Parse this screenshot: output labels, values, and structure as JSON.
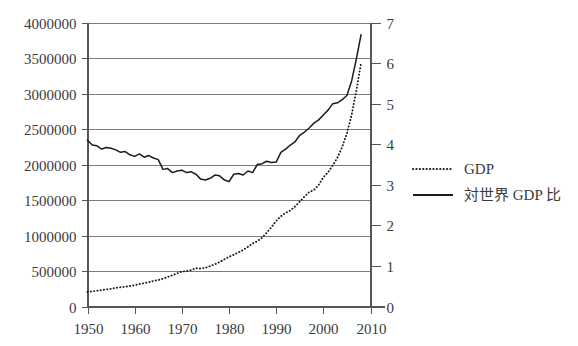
{
  "chart_data": {
    "type": "line",
    "title": "",
    "xlabel": "",
    "ylabel": "",
    "grid": true,
    "legend_position": "right",
    "x": [
      1950,
      1951,
      1952,
      1953,
      1954,
      1955,
      1956,
      1957,
      1958,
      1959,
      1960,
      1961,
      1962,
      1963,
      1964,
      1965,
      1966,
      1967,
      1968,
      1969,
      1970,
      1971,
      1972,
      1973,
      1974,
      1975,
      1976,
      1977,
      1978,
      1979,
      1980,
      1981,
      1982,
      1983,
      1984,
      1985,
      1986,
      1987,
      1988,
      1989,
      1990,
      1991,
      1992,
      1993,
      1994,
      1995,
      1996,
      1997,
      1998,
      1999,
      2000,
      2001,
      2002,
      2003,
      2004,
      2005,
      2006,
      2007,
      2008
    ],
    "xlim": [
      1950,
      2010
    ],
    "xticks": [
      1950,
      1960,
      1970,
      1980,
      1990,
      2000,
      2010
    ],
    "xticklabels": [
      "1950",
      "1960",
      "1970",
      "1980",
      "1990",
      "2000",
      "2010"
    ],
    "left_axis": {
      "name": "GDP",
      "ylim": [
        0,
        4000000
      ],
      "yticks": [
        0,
        500000,
        1000000,
        1500000,
        2000000,
        2500000,
        3000000,
        3500000,
        4000000
      ],
      "yticklabels": [
        "0",
        "500000",
        "1000000",
        "1500000",
        "2000000",
        "2500000",
        "3000000",
        "3500000",
        "4000000"
      ]
    },
    "right_axis": {
      "name": "対世界 GDP 比",
      "ylim": [
        0,
        7
      ],
      "yticks": [
        0,
        1,
        2,
        3,
        4,
        5,
        6,
        7
      ],
      "yticklabels": [
        "0",
        "1",
        "2",
        "3",
        "4",
        "5",
        "6",
        "7"
      ]
    },
    "series": [
      {
        "name": "GDP",
        "style": "dotted",
        "axis": "left",
        "color": "#1c1c1c",
        "values": [
          205000,
          212000,
          222000,
          232000,
          240000,
          250000,
          262000,
          272000,
          278000,
          288000,
          300000,
          316000,
          328000,
          342000,
          360000,
          372000,
          392000,
          416000,
          440000,
          466000,
          492000,
          498000,
          512000,
          540000,
          535000,
          545000,
          568000,
          594000,
          626000,
          664000,
          700000,
          730000,
          762000,
          796000,
          840000,
          886000,
          920000,
          968000,
          1040000,
          1118000,
          1205000,
          1272000,
          1318000,
          1352000,
          1408000,
          1478000,
          1548000,
          1612000,
          1640000,
          1712000,
          1820000,
          1890000,
          1988000,
          2098000,
          2248000,
          2440000,
          2700000,
          3040000,
          3430000
        ]
      },
      {
        "name": "対世界 GDP 比",
        "style": "solid",
        "axis": "right",
        "color": "#1c1c1c",
        "values": [
          4.1,
          3.98,
          3.96,
          3.88,
          3.92,
          3.9,
          3.86,
          3.8,
          3.82,
          3.74,
          3.7,
          3.76,
          3.68,
          3.72,
          3.66,
          3.62,
          3.38,
          3.4,
          3.3,
          3.34,
          3.36,
          3.3,
          3.32,
          3.26,
          3.14,
          3.12,
          3.16,
          3.24,
          3.22,
          3.12,
          3.08,
          3.26,
          3.28,
          3.24,
          3.34,
          3.3,
          3.5,
          3.52,
          3.58,
          3.55,
          3.56,
          3.8,
          3.88,
          3.98,
          4.06,
          4.22,
          4.3,
          4.4,
          4.52,
          4.6,
          4.72,
          4.84,
          5.0,
          5.02,
          5.1,
          5.2,
          5.56,
          6.1,
          6.7
        ]
      }
    ],
    "legend_entries": [
      {
        "label": "GDP",
        "style": "dotted"
      },
      {
        "label": "対世界 GDP 比",
        "style": "solid"
      }
    ]
  }
}
